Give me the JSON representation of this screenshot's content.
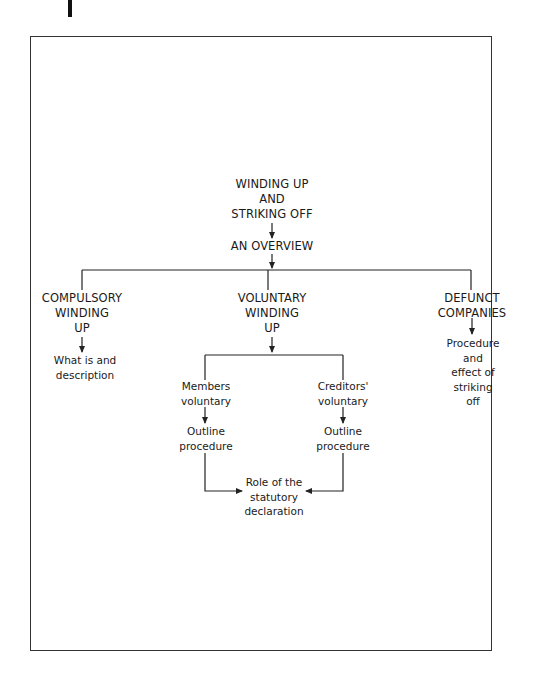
{
  "diagram": {
    "root": {
      "label": "WINDING UP\nAND\nSTRIKING OFF"
    },
    "overview": {
      "label": "AN OVERVIEW"
    },
    "branches": [
      {
        "label": "COMPULSORY\nWINDING\nUP",
        "child": "What is and\ndescription"
      },
      {
        "label": "VOLUNTARY\nWINDING\nUP",
        "sub_branches": [
          {
            "label": "Members\nvoluntary",
            "child": "Outline\nprocedure"
          },
          {
            "label": "Creditors'\nvoluntary",
            "child": "Outline\nprocedure"
          }
        ],
        "merge": "Role of the\nstatutory\ndeclaration"
      },
      {
        "label": "DEFUNCT\nCOMPANIES",
        "child": "Procedure\nand\neffect of\nstriking\noff"
      }
    ],
    "colors": {
      "line": "#222222",
      "text": "#1a1a1a",
      "background": "#ffffff"
    }
  }
}
